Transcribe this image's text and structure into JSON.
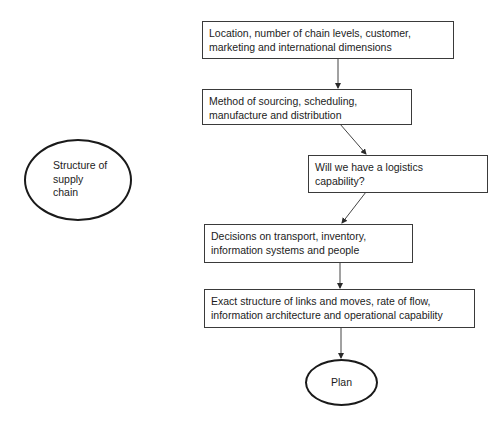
{
  "diagram": {
    "left_node": {
      "label_lines": [
        "Structure of",
        "supply",
        "chain"
      ]
    },
    "steps": [
      {
        "label_lines": [
          "Location, number of chain levels, customer,",
          "marketing and international dimensions"
        ]
      },
      {
        "label_lines": [
          "Method of sourcing, scheduling,",
          "manufacture and distribution"
        ]
      },
      {
        "label_lines": [
          "Will we have a logistics",
          "capability?"
        ]
      },
      {
        "label_lines": [
          "Decisions on transport, inventory,",
          "information systems and people"
        ]
      },
      {
        "label_lines": [
          "Exact structure of links and moves, rate of flow,",
          "information architecture and operational capability"
        ]
      }
    ],
    "end_node": {
      "label": "Plan"
    },
    "colors": {
      "border": "#3a3a3a",
      "ellipse_border": "#1a1a1a",
      "text": "#1c1c1c",
      "background": "#ffffff"
    }
  }
}
